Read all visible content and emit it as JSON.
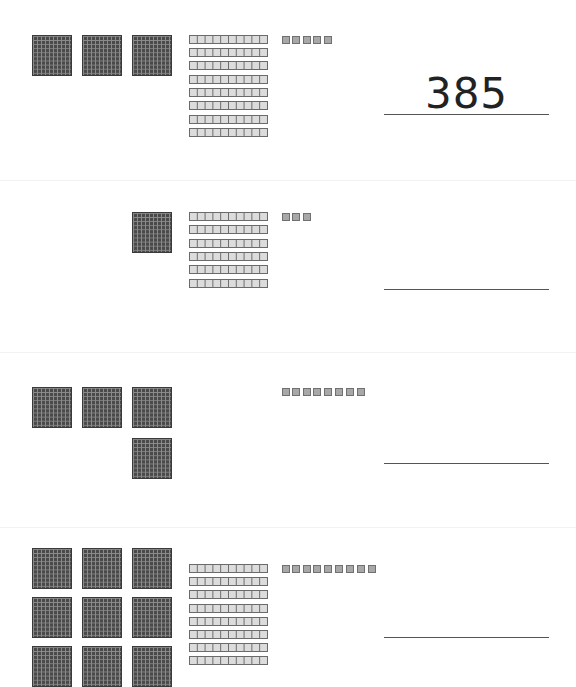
{
  "worksheet": {
    "topic": "Base-ten blocks: write the number",
    "colors": {
      "hundreds_flat": "#4a4a4a",
      "tens_rod": "#dcdcdc",
      "ones_unit": "#a8a8a8",
      "answer_line": "#555555"
    },
    "problems": [
      {
        "hundreds": 3,
        "tens": 8,
        "ones": 5,
        "answer": "385"
      },
      {
        "hundreds": 1,
        "tens": 6,
        "ones": 3,
        "answer": ""
      },
      {
        "hundreds": 4,
        "tens": 0,
        "ones": 8,
        "answer": ""
      },
      {
        "hundreds": 9,
        "tens": 8,
        "ones": 9,
        "answer": ""
      }
    ]
  }
}
